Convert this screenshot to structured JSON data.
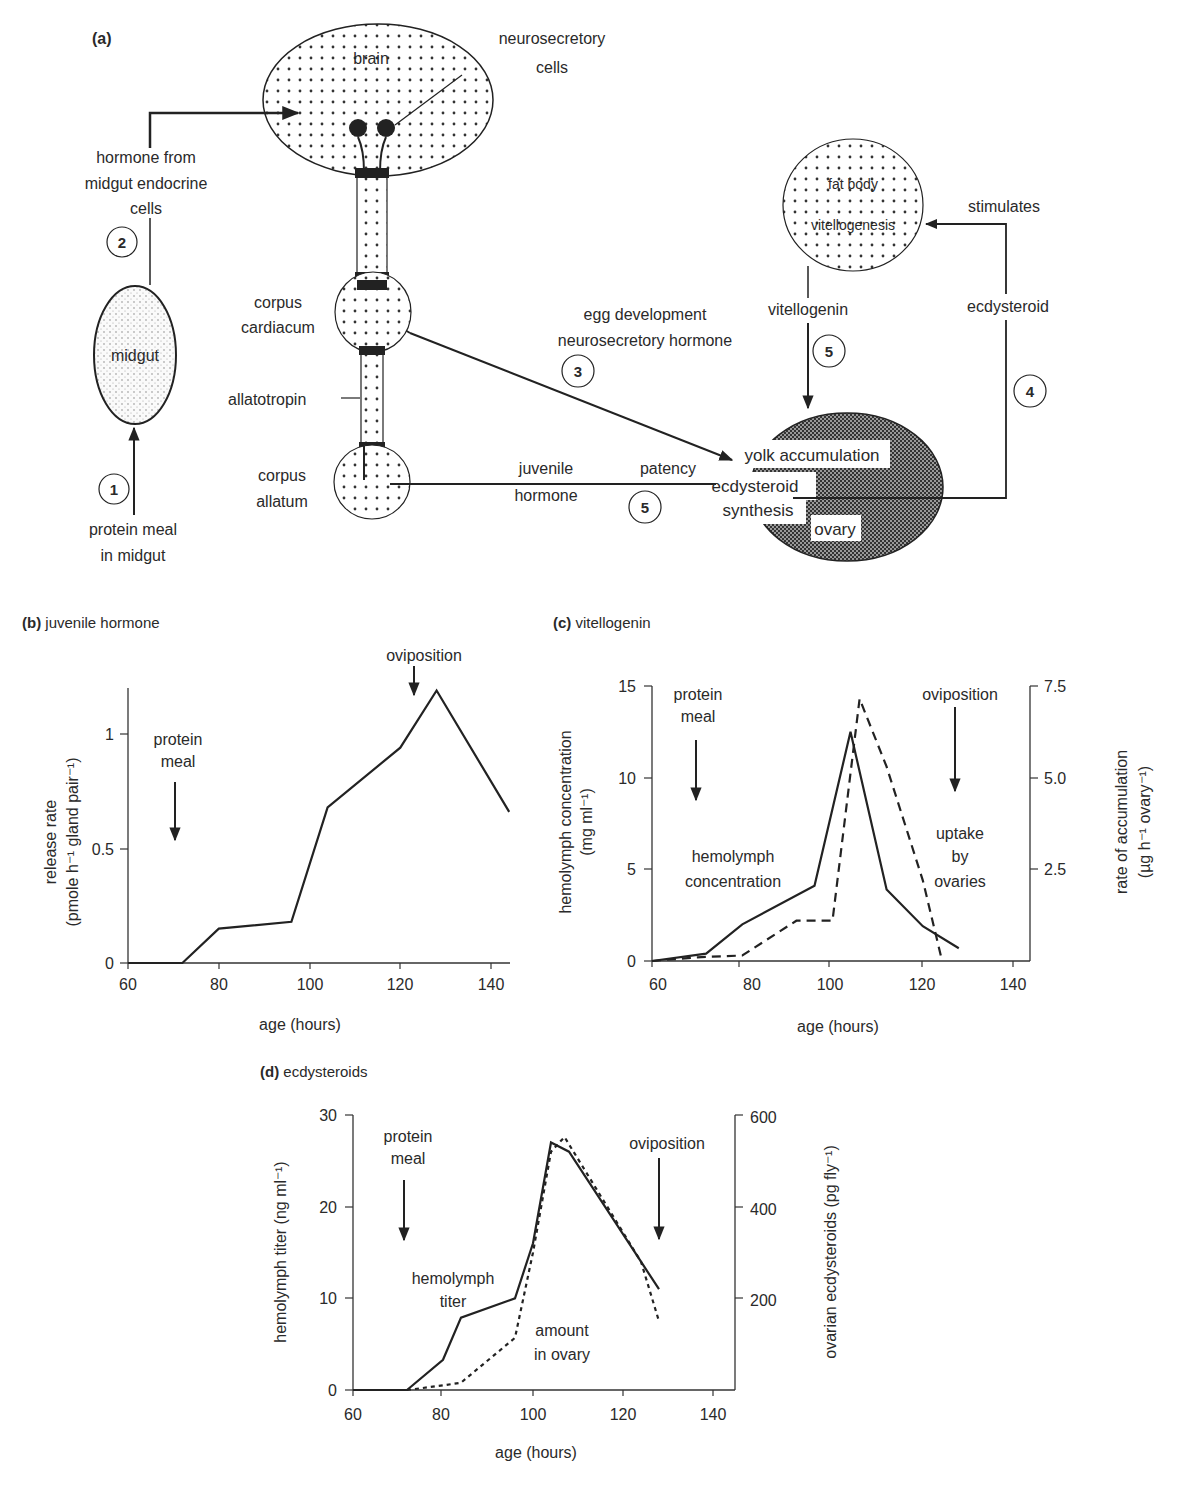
{
  "panel_a": {
    "label": "(a)",
    "brain": "brain",
    "neurosecretory": [
      "neurosecretory",
      "cells"
    ],
    "hormone_from": [
      "hormone from",
      "midgut endocrine",
      "cells"
    ],
    "midgut": "midgut",
    "protein_meal": [
      "protein meal",
      "in midgut"
    ],
    "corpus_cardiacum": [
      "corpus",
      "cardiacum"
    ],
    "allatotropin": "allatotropin",
    "corpus_allatum": [
      "corpus",
      "allatum"
    ],
    "juvenile_hormone": [
      "juvenile",
      "hormone"
    ],
    "patency": "patency",
    "egg_dev": [
      "egg development",
      "neurosecretory hormone"
    ],
    "fat_body": "fat body",
    "vitellogenesis": "vitellogenesis",
    "stimulates": "stimulates",
    "vitellogenin": "vitellogenin",
    "ecdysteroid": "ecdysteroid",
    "yolk_accumulation": "yolk accumulation",
    "ecdysteroid_synthesis": [
      "ecdysteroid",
      "synthesis"
    ],
    "ovary": "ovary",
    "steps": {
      "s1": "1",
      "s2": "2",
      "s3": "3",
      "s4": "4",
      "s5a": "5",
      "s5b": "5"
    }
  },
  "chart_data": [
    {
      "id": "b",
      "type": "line",
      "title": "(b) juvenile hormone",
      "xlabel": "age (hours)",
      "ylabel": [
        "release rate",
        "(pmole h⁻¹ gland pair⁻¹)"
      ],
      "xlim": [
        60,
        144
      ],
      "ylim": [
        0,
        1.2
      ],
      "xticks": [
        "60",
        "80",
        "100",
        "120",
        "140"
      ],
      "yticks": [
        "0",
        "0.5",
        "1"
      ],
      "annotations": [
        "protein meal",
        "oviposition"
      ],
      "series": [
        {
          "name": "release rate",
          "style": "solid",
          "x": [
            60,
            72,
            80,
            96,
            104,
            120,
            128,
            144
          ],
          "y": [
            0,
            0,
            0.15,
            0.18,
            0.68,
            0.94,
            1.19,
            0.66
          ]
        }
      ]
    },
    {
      "id": "c",
      "type": "line",
      "title": "(c) vitellogenin",
      "xlabel": "age (hours)",
      "ylabel": [
        "hemolymph concentration",
        "(mg ml⁻¹)"
      ],
      "ylabel_right": [
        "rate of accumulation",
        "(µg h⁻¹ ovary⁻¹)"
      ],
      "xlim": [
        60,
        144
      ],
      "ylim": [
        0,
        15
      ],
      "ylim_right": [
        0,
        7.5
      ],
      "xticks": [
        "60",
        "80",
        "100",
        "120",
        "140"
      ],
      "yticks": [
        "0",
        "5",
        "10",
        "15"
      ],
      "yticks_right": [
        "2.5",
        "5.0",
        "7.5"
      ],
      "annotations": [
        "protein meal",
        "oviposition",
        "hemolymph concentration",
        "uptake by ovaries"
      ],
      "series": [
        {
          "name": "hemolymph concentration",
          "style": "solid",
          "x": [
            60,
            72,
            80,
            96,
            104,
            112,
            120,
            128
          ],
          "y": [
            0,
            0.4,
            2.0,
            4.1,
            12.5,
            3.9,
            1.9,
            0.7
          ]
        },
        {
          "name": "uptake by ovaries",
          "style": "dashed",
          "axis": "right",
          "x": [
            60,
            70,
            80,
            92,
            100,
            106,
            112,
            120,
            124
          ],
          "y": [
            0,
            0.1,
            0.15,
            1.1,
            1.1,
            7.15,
            5.3,
            2.2,
            0.15
          ]
        }
      ]
    },
    {
      "id": "d",
      "type": "line",
      "title": "(d) ecdysteroids",
      "xlabel": "age (hours)",
      "ylabel": [
        "hemolymph titer (ng ml⁻¹)"
      ],
      "ylabel_right": [
        "ovarian ecdysteroids (pg fly⁻¹)"
      ],
      "xlim": [
        60,
        144
      ],
      "ylim": [
        0,
        30
      ],
      "ylim_right": [
        0,
        600
      ],
      "xticks": [
        "60",
        "80",
        "100",
        "120",
        "140"
      ],
      "yticks": [
        "0",
        "10",
        "20",
        "30"
      ],
      "yticks_right": [
        "200",
        "400",
        "600"
      ],
      "annotations": [
        "protein meal",
        "oviposition",
        "hemolymph titer",
        "amount in ovary"
      ],
      "series": [
        {
          "name": "hemolymph titer",
          "style": "solid",
          "x": [
            60,
            72,
            80,
            84,
            96,
            100,
            104,
            108,
            124,
            128
          ],
          "y": [
            0,
            0,
            3.3,
            7.9,
            10,
            16,
            27,
            26,
            14,
            11
          ]
        },
        {
          "name": "amount in ovary",
          "style": "dotted",
          "axis": "right",
          "x": [
            72,
            80,
            84,
            96,
            100,
            104,
            107,
            124,
            128
          ],
          "y": [
            0,
            10,
            16,
            114,
            300,
            520,
            552,
            280,
            150
          ]
        }
      ]
    }
  ]
}
